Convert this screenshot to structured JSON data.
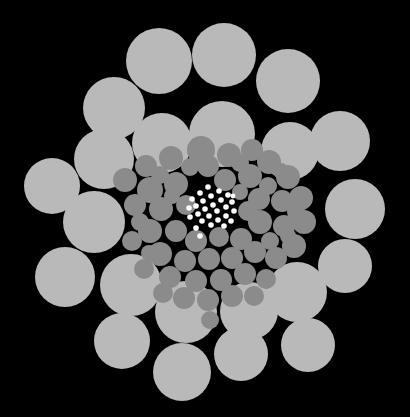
{
  "figure": {
    "width": 410,
    "height": 417,
    "background_color": "#000000",
    "center": {
      "x": 205,
      "y": 206
    }
  },
  "legend": {
    "classes": [
      {
        "name": "large-disc",
        "label": "Large discs",
        "color": "#b9b9b9",
        "count": 28
      },
      {
        "name": "medium-disc",
        "label": "Medium discs",
        "color": "#8b8b8b",
        "count": 60
      },
      {
        "name": "small-disc",
        "label": "Small discs",
        "color": "#ffffff",
        "count": 28
      }
    ]
  },
  "chart_data": {
    "type": "scatter",
    "xlabel": "",
    "ylabel": "",
    "xlim": [
      0,
      410
    ],
    "ylim": [
      0,
      417
    ],
    "grid": false,
    "legend_position": "none",
    "background": "#000000",
    "series": [
      {
        "name": "large-disc",
        "color": "#b9b9b9",
        "marker": "circle",
        "points": [
          {
            "x": 159,
            "y": 61,
            "r": 33
          },
          {
            "x": 224,
            "y": 55,
            "r": 32
          },
          {
            "x": 288,
            "y": 81,
            "r": 32
          },
          {
            "x": 114,
            "y": 108,
            "r": 31
          },
          {
            "x": 340,
            "y": 141,
            "r": 30
          },
          {
            "x": 222,
            "y": 134,
            "r": 33
          },
          {
            "x": 290,
            "y": 151,
            "r": 29
          },
          {
            "x": 162,
            "y": 143,
            "r": 30
          },
          {
            "x": 104,
            "y": 159,
            "r": 30
          },
          {
            "x": 52,
            "y": 186,
            "r": 28
          },
          {
            "x": 355,
            "y": 209,
            "r": 30
          },
          {
            "x": 94,
            "y": 222,
            "r": 31
          },
          {
            "x": 345,
            "y": 266,
            "r": 27
          },
          {
            "x": 65,
            "y": 277,
            "r": 30
          },
          {
            "x": 131,
            "y": 285,
            "r": 31
          },
          {
            "x": 297,
            "y": 292,
            "r": 30
          },
          {
            "x": 186,
            "y": 312,
            "r": 31
          },
          {
            "x": 249,
            "y": 311,
            "r": 29
          },
          {
            "x": 122,
            "y": 341,
            "r": 28
          },
          {
            "x": 308,
            "y": 345,
            "r": 27
          },
          {
            "x": 182,
            "y": 372,
            "r": 29
          },
          {
            "x": 241,
            "y": 354,
            "r": 27
          }
        ]
      },
      {
        "name": "medium-disc",
        "color": "#8b8b8b",
        "marker": "circle",
        "points": [
          {
            "x": 201,
            "y": 150,
            "r": 14
          },
          {
            "x": 229,
            "y": 155,
            "r": 12
          },
          {
            "x": 171,
            "y": 158,
            "r": 12
          },
          {
            "x": 252,
            "y": 150,
            "r": 11
          },
          {
            "x": 146,
            "y": 166,
            "r": 11
          },
          {
            "x": 269,
            "y": 162,
            "r": 12
          },
          {
            "x": 125,
            "y": 180,
            "r": 12
          },
          {
            "x": 288,
            "y": 177,
            "r": 12
          },
          {
            "x": 150,
            "y": 190,
            "r": 13
          },
          {
            "x": 176,
            "y": 184,
            "r": 12
          },
          {
            "x": 250,
            "y": 176,
            "r": 12
          },
          {
            "x": 225,
            "y": 180,
            "r": 11
          },
          {
            "x": 135,
            "y": 205,
            "r": 11
          },
          {
            "x": 301,
            "y": 198,
            "r": 12
          },
          {
            "x": 161,
            "y": 209,
            "r": 12
          },
          {
            "x": 259,
            "y": 199,
            "r": 11
          },
          {
            "x": 282,
            "y": 201,
            "r": 11
          },
          {
            "x": 304,
            "y": 222,
            "r": 12
          },
          {
            "x": 150,
            "y": 231,
            "r": 12
          },
          {
            "x": 176,
            "y": 231,
            "r": 11
          },
          {
            "x": 260,
            "y": 222,
            "r": 12
          },
          {
            "x": 284,
            "y": 226,
            "r": 11
          },
          {
            "x": 132,
            "y": 241,
            "r": 10
          },
          {
            "x": 294,
            "y": 246,
            "r": 12
          },
          {
            "x": 196,
            "y": 241,
            "r": 11
          },
          {
            "x": 219,
            "y": 237,
            "r": 10
          },
          {
            "x": 241,
            "y": 239,
            "r": 11
          },
          {
            "x": 160,
            "y": 254,
            "r": 12
          },
          {
            "x": 185,
            "y": 261,
            "r": 11
          },
          {
            "x": 209,
            "y": 259,
            "r": 11
          },
          {
            "x": 232,
            "y": 258,
            "r": 11
          },
          {
            "x": 255,
            "y": 252,
            "r": 11
          },
          {
            "x": 276,
            "y": 258,
            "r": 11
          },
          {
            "x": 144,
            "y": 269,
            "r": 10
          },
          {
            "x": 170,
            "y": 277,
            "r": 11
          },
          {
            "x": 196,
            "y": 281,
            "r": 11
          },
          {
            "x": 221,
            "y": 280,
            "r": 11
          },
          {
            "x": 245,
            "y": 274,
            "r": 11
          },
          {
            "x": 266,
            "y": 279,
            "r": 10
          },
          {
            "x": 184,
            "y": 298,
            "r": 11
          },
          {
            "x": 208,
            "y": 300,
            "r": 11
          },
          {
            "x": 232,
            "y": 296,
            "r": 11
          },
          {
            "x": 254,
            "y": 296,
            "r": 10
          },
          {
            "x": 163,
            "y": 293,
            "r": 10
          },
          {
            "x": 208,
            "y": 166,
            "r": 11
          },
          {
            "x": 190,
            "y": 167,
            "r": 9
          },
          {
            "x": 240,
            "y": 163,
            "r": 9
          },
          {
            "x": 140,
            "y": 222,
            "r": 9
          },
          {
            "x": 296,
            "y": 212,
            "r": 9
          },
          {
            "x": 186,
            "y": 205,
            "r": 10
          },
          {
            "x": 248,
            "y": 211,
            "r": 10
          },
          {
            "x": 268,
            "y": 186,
            "r": 9
          },
          {
            "x": 160,
            "y": 175,
            "r": 9
          },
          {
            "x": 270,
            "y": 241,
            "r": 9
          },
          {
            "x": 210,
            "y": 320,
            "r": 9
          },
          {
            "x": 149,
            "y": 253,
            "r": 8
          },
          {
            "x": 281,
            "y": 171,
            "r": 8
          },
          {
            "x": 240,
            "y": 192,
            "r": 8
          },
          {
            "x": 172,
            "y": 196,
            "r": 8
          },
          {
            "x": 288,
            "y": 236,
            "r": 8
          }
        ]
      },
      {
        "name": "small-disc",
        "color": "#ffffff",
        "marker": "circle",
        "points": [
          {
            "x": 208,
            "y": 187,
            "r": 2.8
          },
          {
            "x": 219,
            "y": 191,
            "r": 2.8
          },
          {
            "x": 200,
            "y": 193,
            "r": 2.8
          },
          {
            "x": 228,
            "y": 195,
            "r": 2.8
          },
          {
            "x": 211,
            "y": 196,
            "r": 2.8
          },
          {
            "x": 192,
            "y": 199,
            "r": 2.8
          },
          {
            "x": 203,
            "y": 201,
            "r": 2.8
          },
          {
            "x": 221,
            "y": 200,
            "r": 2.8
          },
          {
            "x": 232,
            "y": 202,
            "r": 2.8
          },
          {
            "x": 213,
            "y": 205,
            "r": 2.8
          },
          {
            "x": 196,
            "y": 206,
            "r": 2.8
          },
          {
            "x": 226,
            "y": 207,
            "r": 2.8
          },
          {
            "x": 205,
            "y": 209,
            "r": 2.8
          },
          {
            "x": 189,
            "y": 208,
            "r": 2.8
          },
          {
            "x": 217,
            "y": 211,
            "r": 2.8
          },
          {
            "x": 234,
            "y": 211,
            "r": 2.8
          },
          {
            "x": 198,
            "y": 214,
            "r": 2.8
          },
          {
            "x": 209,
            "y": 216,
            "r": 2.8
          },
          {
            "x": 226,
            "y": 216,
            "r": 2.8
          },
          {
            "x": 190,
            "y": 217,
            "r": 2.8
          },
          {
            "x": 218,
            "y": 220,
            "r": 2.8
          },
          {
            "x": 202,
            "y": 221,
            "r": 2.8
          },
          {
            "x": 231,
            "y": 221,
            "r": 2.8
          },
          {
            "x": 211,
            "y": 225,
            "r": 2.8
          },
          {
            "x": 224,
            "y": 226,
            "r": 2.8
          },
          {
            "x": 196,
            "y": 228,
            "r": 2.8
          },
          {
            "x": 233,
            "y": 196,
            "r": 2.4
          },
          {
            "x": 200,
            "y": 236,
            "r": 2.8
          }
        ]
      }
    ]
  }
}
